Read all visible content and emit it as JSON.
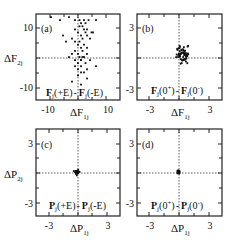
{
  "figure": {
    "panels": [
      {
        "id": "(a)",
        "xlabel": "ΔF",
        "xsub": "1j",
        "ylabel": "ΔF",
        "ysub": "2j",
        "xticks": [
          "-10",
          "10"
        ],
        "yticks": [
          "10",
          "-10"
        ],
        "legend_left": "F",
        "legend_left_sub": "j",
        "legend_left_arg": "(+E)",
        "legend_sep": "-",
        "legend_right": "F",
        "legend_right_sub": "j",
        "legend_right_arg": "(-E)"
      },
      {
        "id": "(b)",
        "xlabel": "ΔF",
        "xsub": "1j",
        "ylabel": "",
        "ysub": "",
        "xticks": [
          "-3",
          "3"
        ],
        "yticks": [
          "3",
          "-3"
        ],
        "legend_left": "F",
        "legend_left_sub": "j",
        "legend_left_arg": "(0",
        "legend_left_sup": "+",
        "legend_left_close": ")",
        "legend_sep": "-",
        "legend_right": "F",
        "legend_right_sub": "j",
        "legend_right_arg": "(0",
        "legend_right_sup": "-",
        "legend_right_close": ")"
      },
      {
        "id": "(c)",
        "xlabel": "ΔP",
        "xsub": "1j",
        "ylabel": "ΔP",
        "ysub": "2j",
        "xticks": [
          "-3",
          "3"
        ],
        "yticks": [
          "3",
          "-3"
        ],
        "legend_left": "P",
        "legend_left_sub": "j",
        "legend_left_arg": "(+E)",
        "legend_sep": "-",
        "legend_right": "P",
        "legend_right_sub": "j",
        "legend_right_arg": "(-E)"
      },
      {
        "id": "(d)",
        "xlabel": "ΔP",
        "xsub": "1j",
        "ylabel": "",
        "ysub": "",
        "xticks": [
          "-3",
          "3"
        ],
        "yticks": [
          "3",
          "-3"
        ],
        "legend_left": "P",
        "legend_left_sub": "j",
        "legend_left_arg": "(0",
        "legend_left_sup": "+",
        "legend_left_close": ")",
        "legend_sep": "-",
        "legend_right": "P",
        "legend_right_sub": "j",
        "legend_right_arg": "(0",
        "legend_right_sup": "-",
        "legend_right_close": ")"
      }
    ]
  },
  "chart_data": [
    {
      "type": "scatter",
      "title": "(a)",
      "xlabel": "ΔF1j",
      "ylabel": "ΔF2j",
      "xlim": [
        -14,
        14
      ],
      "ylim": [
        -14,
        14
      ],
      "xticks": [
        -10,
        10
      ],
      "yticks": [
        -10,
        10
      ],
      "grid": false,
      "reference_lines": {
        "x": 0,
        "y": 0,
        "style": "dotted"
      },
      "annotation": "Fj(+E) - Fj(-E)",
      "x": [
        -9,
        -6,
        -3,
        -1,
        0.5,
        1,
        1.5,
        2,
        2.5,
        3,
        3.5,
        4.5,
        6,
        -1,
        0,
        0.5,
        1,
        1.5,
        2,
        2.5,
        3,
        4,
        5,
        -5,
        -4,
        -2,
        -1,
        0,
        0.5,
        1,
        1.5,
        2,
        3,
        -2,
        -1,
        0,
        0.5,
        1,
        2,
        3,
        -3,
        -1,
        0,
        1,
        1.5,
        2.5,
        4,
        6,
        -1,
        0,
        1,
        2,
        3,
        0,
        1,
        3,
        -2,
        1
      ],
      "y": [
        13,
        12,
        13,
        12,
        12,
        11,
        10,
        12,
        11,
        9,
        12,
        8,
        12,
        9,
        8,
        10,
        7,
        6,
        9,
        8,
        7,
        6,
        8,
        7,
        5,
        6,
        5,
        4,
        5,
        3,
        2,
        4,
        3,
        1,
        2,
        1,
        0,
        -1,
        0,
        1,
        0,
        -1,
        -2,
        -1,
        0,
        -2,
        -1,
        -3,
        -3,
        -4,
        -3,
        -5,
        -4,
        -6,
        -5,
        -7,
        -8,
        -9
      ]
    },
    {
      "type": "scatter",
      "title": "(b)",
      "xlabel": "ΔF1j",
      "ylabel": "",
      "xlim": [
        -4.2,
        4.2
      ],
      "ylim": [
        -4.2,
        4.2
      ],
      "xticks": [
        -3,
        3
      ],
      "yticks": [
        -3,
        3
      ],
      "grid": false,
      "reference_lines": {
        "x": 0,
        "y": 0,
        "style": "dotted"
      },
      "annotation": "Fj(0+) - Fj(0-)",
      "cluster": {
        "center": [
          0.3,
          0.2
        ],
        "spread": [
          0.6,
          0.8
        ],
        "count_estimate": 60
      }
    },
    {
      "type": "scatter",
      "title": "(c)",
      "xlabel": "ΔP1j",
      "ylabel": "ΔP2j",
      "xlim": [
        -4.2,
        4.2
      ],
      "ylim": [
        -4.2,
        4.2
      ],
      "xticks": [
        -3,
        3
      ],
      "yticks": [
        -3,
        3
      ],
      "grid": false,
      "reference_lines": {
        "x": 0,
        "y": 0,
        "style": "dotted"
      },
      "annotation": "Pj(+E) - Pj(-E)",
      "cluster": {
        "center": [
          -0.1,
          0.05
        ],
        "spread": [
          0.15,
          0.15
        ],
        "count_estimate": 60
      }
    },
    {
      "type": "scatter",
      "title": "(d)",
      "xlabel": "ΔP1j",
      "ylabel": "",
      "xlim": [
        -4.2,
        4.2
      ],
      "ylim": [
        -4.2,
        4.2
      ],
      "xticks": [
        -3,
        3
      ],
      "yticks": [
        -3,
        3
      ],
      "grid": false,
      "reference_lines": {
        "x": 0,
        "y": 0,
        "style": "dotted"
      },
      "annotation": "Pj(0+) - Pj(0-)",
      "cluster": {
        "center": [
          -0.1,
          0.05
        ],
        "spread": [
          0.12,
          0.15
        ],
        "count_estimate": 60
      }
    }
  ]
}
